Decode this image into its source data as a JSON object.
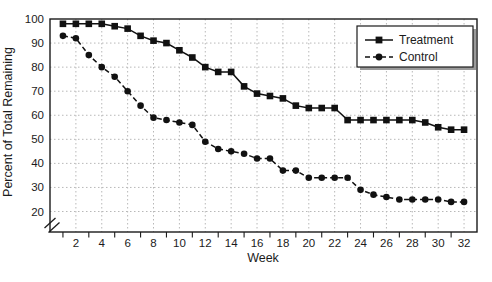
{
  "chart_data": {
    "type": "line",
    "title": "",
    "xlabel": "Week",
    "ylabel": "Percent of Total Remaining",
    "x": [
      1,
      2,
      3,
      4,
      5,
      6,
      7,
      8,
      9,
      10,
      11,
      12,
      13,
      14,
      15,
      16,
      17,
      18,
      19,
      20,
      21,
      22,
      23,
      24,
      25,
      26,
      27,
      28,
      29,
      30,
      31,
      32
    ],
    "series": [
      {
        "name": "Treatment",
        "marker": "square",
        "line_style": "solid",
        "color": "#111111",
        "values": [
          98,
          98,
          98,
          98,
          97,
          96,
          93,
          91,
          90,
          87,
          84,
          80,
          78,
          78,
          72,
          69,
          68,
          67,
          64,
          63,
          63,
          63,
          58,
          58,
          58,
          58,
          58,
          58,
          57,
          55,
          54,
          54
        ]
      },
      {
        "name": "Control",
        "marker": "circle",
        "line_style": "dashed",
        "color": "#111111",
        "values": [
          93,
          92,
          85,
          80,
          76,
          70,
          64,
          59,
          58,
          57,
          56,
          49,
          46,
          45,
          44,
          42,
          42,
          37,
          37,
          34,
          34,
          34,
          34,
          29,
          27,
          26,
          25,
          25,
          25,
          25,
          24,
          24
        ]
      }
    ],
    "xlim": [
      0,
      33
    ],
    "ylim": [
      20,
      100
    ],
    "x_tick_labels": [
      2,
      4,
      6,
      8,
      10,
      12,
      14,
      16,
      18,
      20,
      22,
      24,
      26,
      28,
      30,
      32
    ],
    "x_minor_ticks": [
      1,
      3,
      5,
      7,
      9,
      11,
      13,
      15,
      17,
      19,
      21,
      23,
      25,
      27,
      29,
      31
    ],
    "y_ticks": [
      20,
      30,
      40,
      50,
      60,
      70,
      80,
      90,
      100
    ],
    "y_axis_break_below": 20,
    "grid": "dotted",
    "legend_position": "top-right",
    "colors": {
      "line": "#111111",
      "grid": "#b8b8b8",
      "frame": "#1b1b1b",
      "background": "#ffffff",
      "legend_shadow": "#9a9a9a"
    }
  }
}
